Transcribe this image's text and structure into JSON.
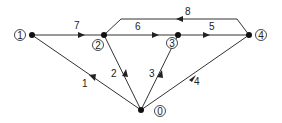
{
  "diagram": {
    "type": "directed network graph",
    "nodes": [
      {
        "id": "0",
        "label": "0",
        "x": 141,
        "y": 110
      },
      {
        "id": "1",
        "label": "1",
        "x": 32,
        "y": 35
      },
      {
        "id": "2",
        "label": "2",
        "x": 104,
        "y": 35
      },
      {
        "id": "3",
        "label": "3",
        "x": 178,
        "y": 35
      },
      {
        "id": "4",
        "label": "4",
        "x": 249,
        "y": 35
      }
    ],
    "edges": [
      {
        "label": "1",
        "from": "0",
        "to": "1"
      },
      {
        "label": "2",
        "from": "0",
        "to": "2"
      },
      {
        "label": "3",
        "from": "0",
        "to": "3"
      },
      {
        "label": "4",
        "from": "0",
        "to": "4"
      },
      {
        "label": "5",
        "from": "3",
        "to": "4"
      },
      {
        "label": "6",
        "from": "2",
        "to": "3"
      },
      {
        "label": "7",
        "from": "1",
        "to": "2"
      },
      {
        "label": "8",
        "from": "4",
        "to": "2"
      }
    ]
  }
}
